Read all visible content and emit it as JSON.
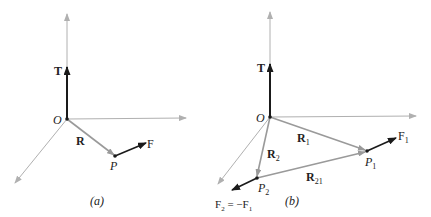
{
  "colors": {
    "axis": "#b0b0b0",
    "vector_gray": "#9a9a9a",
    "vector_dark": "#1a1a1a",
    "text": "#222222",
    "background": "#ffffff"
  },
  "panel_a": {
    "caption": "(a)",
    "origin_label": "O",
    "torque_label": "T",
    "position_label": "R",
    "point_label": "P",
    "force_label": "F"
  },
  "panel_b": {
    "caption": "(b)",
    "origin_label": "O",
    "torque_label": "T",
    "r1_label": "R",
    "r1_sub": "1",
    "r2_label": "R",
    "r2_sub": "2",
    "r21_label": "R",
    "r21_sub": "21",
    "p1_label": "P",
    "p1_sub": "1",
    "p2_label": "P",
    "p2_sub": "2",
    "f1_label": "F",
    "f1_sub": "1",
    "f2_label": "F",
    "f2_sub": "2",
    "f2_eq": " = −F",
    "f2_eq_sub": "1"
  }
}
